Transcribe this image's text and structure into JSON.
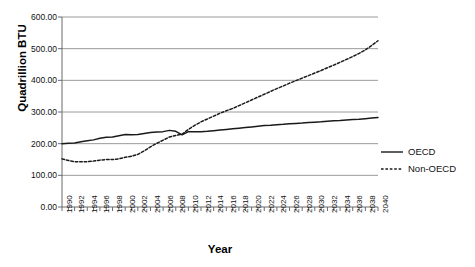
{
  "chart_data": {
    "type": "line",
    "title": "",
    "xlabel": "Year",
    "ylabel": "Quadrillion BTU",
    "xlim": [
      1990,
      2040
    ],
    "ylim": [
      0,
      600
    ],
    "grid": "horizontal",
    "legend_position": "right",
    "y_ticks": [
      "0.00",
      "100.00",
      "200.00",
      "300.00",
      "400.00",
      "500.00",
      "600.00"
    ],
    "y_tick_values": [
      0,
      100,
      200,
      300,
      400,
      500,
      600
    ],
    "x_ticks": [
      "1990",
      "1992",
      "1994",
      "1996",
      "1998",
      "2000",
      "2002",
      "2004",
      "2006",
      "2008",
      "2010",
      "2012",
      "2014",
      "2016",
      "2018",
      "2020",
      "2022",
      "2024",
      "2026",
      "2028",
      "2030",
      "2032",
      "2034",
      "2036",
      "2038",
      "2040"
    ],
    "x": [
      1990,
      1991,
      1992,
      1993,
      1994,
      1995,
      1996,
      1997,
      1998,
      1999,
      2000,
      2001,
      2002,
      2003,
      2004,
      2005,
      2006,
      2007,
      2008,
      2009,
      2010,
      2011,
      2012,
      2013,
      2014,
      2015,
      2016,
      2017,
      2018,
      2019,
      2020,
      2021,
      2022,
      2023,
      2024,
      2025,
      2026,
      2027,
      2028,
      2029,
      2030,
      2031,
      2032,
      2033,
      2034,
      2035,
      2036,
      2037,
      2038,
      2039,
      2040
    ],
    "series": [
      {
        "name": "OECD",
        "style": "solid",
        "color": "#1a1a1a",
        "values": [
          200,
          201,
          202,
          206,
          209,
          212,
          217,
          220,
          221,
          225,
          229,
          228,
          229,
          232,
          235,
          237,
          238,
          242,
          239,
          228,
          238,
          238,
          238,
          239,
          241,
          243,
          245,
          247,
          249,
          251,
          253,
          255,
          257,
          258,
          260,
          261,
          263,
          264,
          265,
          267,
          268,
          269,
          271,
          272,
          273,
          275,
          276,
          277,
          279,
          281,
          283
        ]
      },
      {
        "name": "Non-OECD",
        "style": "dotted",
        "color": "#1a1a1a",
        "values": [
          152,
          147,
          143,
          143,
          143,
          145,
          148,
          150,
          150,
          152,
          157,
          160,
          166,
          177,
          190,
          201,
          211,
          221,
          226,
          230,
          245,
          258,
          269,
          278,
          287,
          296,
          304,
          311,
          320,
          329,
          338,
          347,
          356,
          365,
          374,
          382,
          391,
          399,
          407,
          415,
          423,
          431,
          440,
          448,
          457,
          466,
          475,
          485,
          496,
          510,
          525
        ]
      }
    ]
  },
  "legend": {
    "items": [
      {
        "label": "OECD",
        "style": "solid"
      },
      {
        "label": "Non-OECD",
        "style": "dotted"
      }
    ]
  }
}
